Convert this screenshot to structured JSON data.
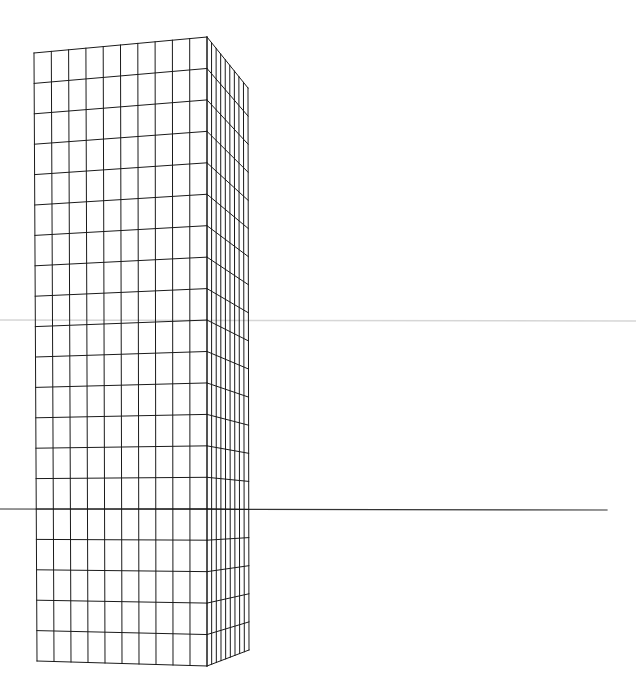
{
  "canvas": {
    "width": 636,
    "height": 700,
    "background": "#ffffff"
  },
  "colors": {
    "grid": "#1a1a1a",
    "horizon": "#333333",
    "guide": "#d6d6d6"
  },
  "lines": {
    "horizon": {
      "x1": 0,
      "y1": 509,
      "x2": 607,
      "y2": 510
    },
    "guide": {
      "x1": 0,
      "y1": 320,
      "x2": 636,
      "y2": 321
    }
  },
  "tower": {
    "front_face": {
      "top_left": [
        34,
        53
      ],
      "top_right": [
        207,
        37
      ],
      "bottom_left": [
        37,
        661
      ],
      "bottom_right": [
        207,
        666
      ],
      "columns": 10,
      "rows": 20
    },
    "side_face": {
      "top_left": [
        207,
        37
      ],
      "top_right": [
        248,
        88
      ],
      "bottom_left": [
        207,
        666
      ],
      "bottom_right": [
        249,
        650
      ],
      "columns": 9,
      "rows": 20
    }
  }
}
